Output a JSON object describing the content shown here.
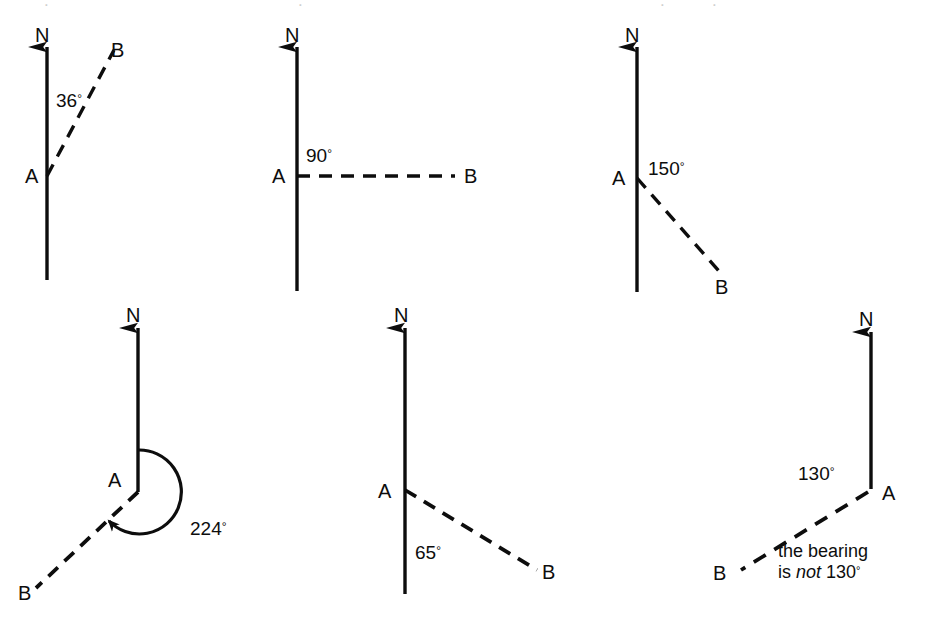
{
  "page": {
    "background": "#ffffff",
    "ink": "#0d0d0d",
    "width": 942,
    "height": 617
  },
  "figures": [
    {
      "id": "fig-36",
      "name": "bearing-36",
      "north_label": "N",
      "origin_label": "A",
      "target_label": "B",
      "angle_label": "36",
      "degree_symbol": "°",
      "bearing_degrees": 36,
      "annotation": ""
    },
    {
      "id": "fig-90",
      "name": "bearing-90",
      "north_label": "N",
      "origin_label": "A",
      "target_label": "B",
      "angle_label": "90",
      "degree_symbol": "°",
      "bearing_degrees": 90,
      "annotation": ""
    },
    {
      "id": "fig-150",
      "name": "bearing-150",
      "north_label": "N",
      "origin_label": "A",
      "target_label": "B",
      "angle_label": "150",
      "degree_symbol": "°",
      "bearing_degrees": 150,
      "annotation": ""
    },
    {
      "id": "fig-224",
      "name": "bearing-224",
      "north_label": "N",
      "origin_label": "A",
      "target_label": "B",
      "angle_label": "224",
      "degree_symbol": "°",
      "bearing_degrees": 224,
      "annotation": ""
    },
    {
      "id": "fig-65",
      "name": "bearing-65",
      "north_label": "N",
      "origin_label": "A",
      "target_label": "B",
      "angle_label": "65",
      "degree_symbol": "°",
      "bearing_degrees": 65,
      "annotation": ""
    },
    {
      "id": "fig-130-not",
      "name": "bearing-130-incorrect",
      "north_label": "N",
      "origin_label": "A",
      "target_label": "B",
      "angle_label": "130",
      "degree_symbol": "°",
      "bearing_degrees": 130,
      "annotation_line1": "the bearing",
      "annotation_line2_pre": "is ",
      "annotation_line2_em": "not",
      "annotation_line2_post": " 130"
    }
  ]
}
